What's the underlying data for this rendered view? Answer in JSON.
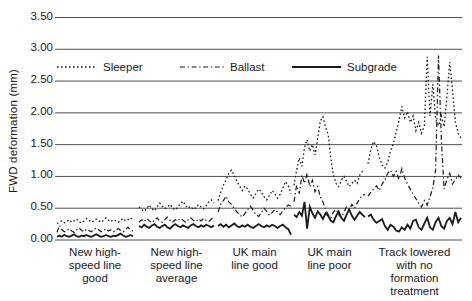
{
  "colors": {
    "background": "#ffffff",
    "line": "#1a1a1a",
    "grid": "#4f4f4f",
    "text": "#1a1a1a"
  },
  "chart_data": {
    "type": "line",
    "title": "",
    "xlabel": "",
    "ylabel": "FWD deformation (mm)",
    "ylim": [
      0,
      3.5
    ],
    "ytick_step": 0.5,
    "yticks": [
      "3.50",
      "3.00",
      "2.50",
      "2.00",
      "1.50",
      "1.00",
      "0.50",
      "0.00"
    ],
    "grid": "horizontal",
    "legend_position": "top-inside",
    "legend": [
      {
        "name": "Sleeper",
        "style": "dotted"
      },
      {
        "name": "Ballast",
        "style": "dashdot"
      },
      {
        "name": "Subgrade",
        "style": "solid"
      }
    ],
    "sections": [
      {
        "label_lines": [
          "New high-",
          "speed line",
          "good"
        ],
        "x_range": [
          57,
          133
        ],
        "series": {
          "Sleeper": [
            0.26,
            0.28,
            0.3,
            0.27,
            0.29,
            0.32,
            0.28,
            0.3,
            0.33,
            0.29,
            0.27,
            0.3,
            0.34,
            0.31,
            0.28,
            0.3,
            0.33,
            0.3,
            0.28,
            0.31,
            0.35,
            0.31,
            0.29,
            0.32,
            0.3,
            0.28,
            0.31,
            0.34,
            0.3,
            0.32,
            0.35,
            0.31
          ],
          "Ballast": [
            0.12,
            0.23,
            0.16,
            0.13,
            0.15,
            0.18,
            0.14,
            0.12,
            0.16,
            0.19,
            0.15,
            0.13,
            0.17,
            0.15,
            0.13,
            0.16,
            0.19,
            0.16,
            0.13,
            0.15,
            0.18,
            0.14,
            0.16,
            0.13,
            0.15,
            0.18,
            0.15,
            0.13,
            0.17,
            0.2,
            0.16,
            0.14
          ],
          "Subgrade": [
            0.05,
            0.07,
            0.05,
            0.08,
            0.06,
            0.05,
            0.07,
            0.09,
            0.06,
            0.05,
            0.07,
            0.06,
            0.08,
            0.06,
            0.05,
            0.07,
            0.09,
            0.07,
            0.05,
            0.06,
            0.08,
            0.06,
            0.05,
            0.07,
            0.06,
            0.08,
            0.1,
            0.07,
            0.05,
            0.06,
            0.08,
            0.06
          ]
        }
      },
      {
        "label_lines": [
          "New high-",
          "speed line",
          "average"
        ],
        "x_range": [
          139,
          214
        ],
        "series": {
          "Sleeper": [
            0.52,
            0.48,
            0.45,
            0.5,
            0.55,
            0.49,
            0.46,
            0.52,
            0.58,
            0.53,
            0.49,
            0.52,
            0.56,
            0.5,
            0.47,
            0.52,
            0.57,
            0.61,
            0.54,
            0.5,
            0.53,
            0.48,
            0.51,
            0.56,
            0.52,
            0.49,
            0.54,
            0.6,
            0.63,
            0.58
          ],
          "Ballast": [
            0.28,
            0.32,
            0.29,
            0.34,
            0.3,
            0.27,
            0.31,
            0.35,
            0.3,
            0.28,
            0.32,
            0.36,
            0.31,
            0.28,
            0.32,
            0.3,
            0.34,
            0.31,
            0.28,
            0.32,
            0.35,
            0.31,
            0.29,
            0.33,
            0.3,
            0.34,
            0.31,
            0.29,
            0.33,
            0.36
          ],
          "Subgrade": [
            0.22,
            0.2,
            0.24,
            0.21,
            0.19,
            0.23,
            0.25,
            0.21,
            0.19,
            0.22,
            0.24,
            0.2,
            0.18,
            0.22,
            0.25,
            0.22,
            0.2,
            0.23,
            0.21,
            0.19,
            0.23,
            0.25,
            0.22,
            0.2,
            0.23,
            0.21,
            0.24,
            0.22,
            0.2,
            0.23
          ]
        }
      },
      {
        "label_lines": [
          "UK main",
          "line good"
        ],
        "x_range": [
          218,
          291
        ],
        "series": {
          "Sleeper": [
            0.62,
            0.75,
            0.86,
            0.95,
            1.05,
            1.1,
            1.02,
            0.92,
            0.85,
            0.78,
            0.85,
            0.8,
            0.72,
            0.66,
            0.73,
            0.8,
            0.76,
            0.68,
            0.63,
            0.7,
            0.78,
            0.73,
            0.66,
            0.72,
            0.82,
            0.92,
            0.85,
            0.73
          ],
          "Ballast": [
            0.44,
            0.56,
            0.62,
            0.69,
            0.6,
            0.56,
            0.5,
            0.44,
            0.4,
            0.36,
            0.42,
            0.48,
            0.53,
            0.47,
            0.4,
            0.37,
            0.43,
            0.5,
            0.45,
            0.39,
            0.43,
            0.48,
            0.44,
            0.4,
            0.46,
            0.51,
            0.55,
            0.53
          ],
          "Subgrade": [
            0.22,
            0.25,
            0.21,
            0.24,
            0.2,
            0.23,
            0.26,
            0.22,
            0.2,
            0.23,
            0.21,
            0.24,
            0.21,
            0.19,
            0.22,
            0.25,
            0.22,
            0.2,
            0.23,
            0.21,
            0.24,
            0.22,
            0.19,
            0.22,
            0.24,
            0.2,
            0.17,
            0.08
          ]
        }
      },
      {
        "label_lines": [
          "UK main",
          "line poor"
        ],
        "x_range": [
          294,
          365
        ],
        "series": {
          "Sleeper": [
            0.86,
            1.1,
            1.29,
            1.16,
            1.45,
            1.58,
            1.4,
            1.5,
            1.34,
            1.6,
            1.87,
            1.94,
            1.77,
            1.66,
            1.29,
            1.02,
            0.89,
            0.84,
            0.94,
            1.0,
            0.92,
            0.84,
            0.89,
            0.94,
            0.89,
            1.02,
            1.08,
            1.1
          ],
          "Ballast": [
            0.6,
            0.86,
            0.73,
            1.02,
            0.89,
            1.05,
            0.84,
            0.94,
            0.76,
            0.84,
            0.68,
            0.6,
            0.48,
            0.4,
            0.35,
            0.44,
            0.48,
            0.4,
            0.35,
            0.44,
            0.52,
            0.48,
            0.56,
            0.5,
            0.58,
            0.65,
            0.7,
            0.72
          ],
          "Subgrade": [
            0.4,
            0.36,
            0.44,
            0.38,
            0.6,
            0.18,
            0.52,
            0.42,
            0.35,
            0.45,
            0.4,
            0.33,
            0.42,
            0.38,
            0.3,
            0.28,
            0.38,
            0.45,
            0.35,
            0.3,
            0.4,
            0.48,
            0.38,
            0.32,
            0.38,
            0.44,
            0.4,
            0.36
          ]
        }
      },
      {
        "label_lines": [
          "Track lowered",
          "with no",
          "formation",
          "treatment"
        ],
        "x_range": [
          368,
          461
        ],
        "series": {
          "Sleeper": [
            1.2,
            1.42,
            1.55,
            1.48,
            1.3,
            1.18,
            1.13,
            1.22,
            1.4,
            1.52,
            1.7,
            1.88,
            2.1,
            1.92,
            2.02,
            1.85,
            1.95,
            1.72,
            1.85,
            1.68,
            1.8,
            2.88,
            1.95,
            2.45,
            1.9,
            1.8,
            1.95,
            1.78,
            2.25,
            2.8,
            2.35,
            1.85,
            1.68,
            1.6
          ],
          "Ballast": [
            0.69,
            0.75,
            0.8,
            0.85,
            0.78,
            0.88,
            0.95,
            1.05,
            1.1,
            1.0,
            1.08,
            0.95,
            1.12,
            0.98,
            0.88,
            0.8,
            0.72,
            0.65,
            0.58,
            0.52,
            0.62,
            0.55,
            0.68,
            0.82,
            1.1,
            2.9,
            1.6,
            0.8,
            0.95,
            1.05,
            0.88,
            0.95,
            1.02,
            0.98
          ],
          "Subgrade": [
            0.37,
            0.4,
            0.32,
            0.27,
            0.3,
            0.33,
            0.22,
            0.16,
            0.24,
            0.21,
            0.15,
            0.13,
            0.2,
            0.16,
            0.24,
            0.18,
            0.3,
            0.32,
            0.2,
            0.16,
            0.26,
            0.35,
            0.2,
            0.16,
            0.28,
            0.35,
            0.22,
            0.18,
            0.3,
            0.35,
            0.25,
            0.44,
            0.28,
            0.35
          ]
        }
      }
    ]
  }
}
